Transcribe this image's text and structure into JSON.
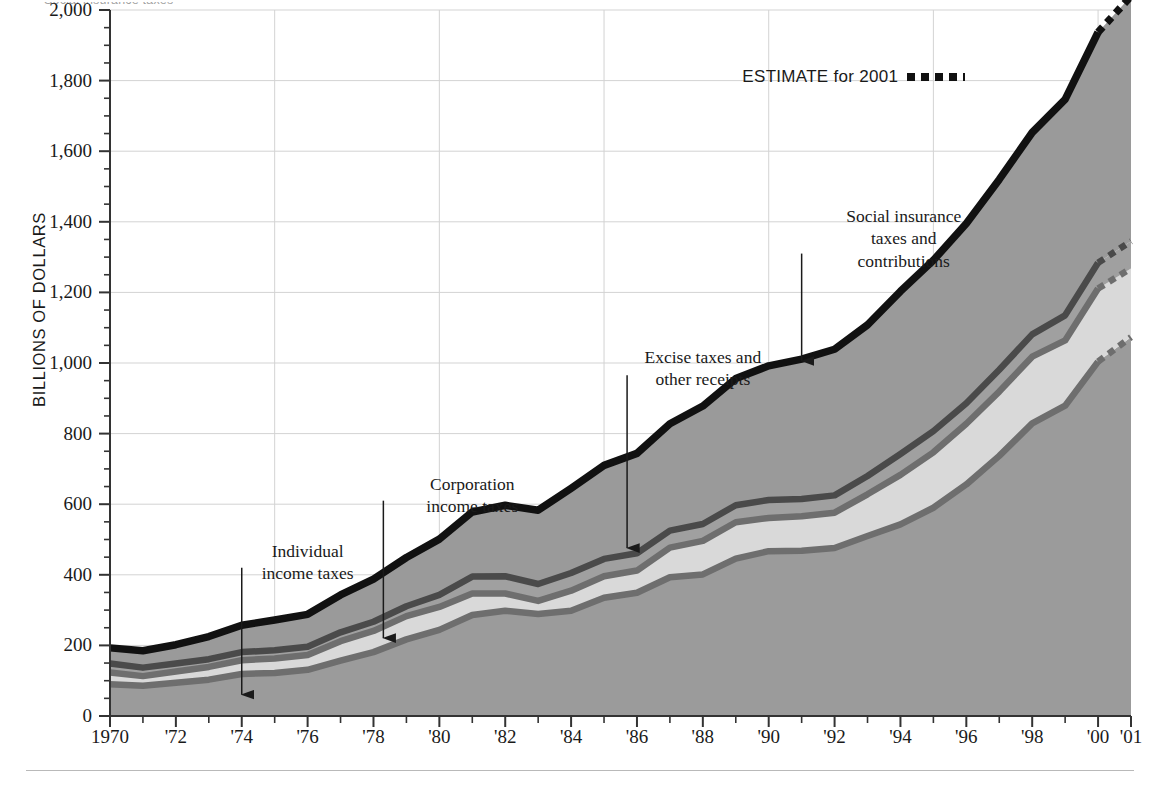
{
  "figure": {
    "top_caption_remnant": "Social insurance taxes",
    "bottom_rule": true
  },
  "legend": {
    "estimate_label": "ESTIMATE for 2001",
    "estimate_swatch": "dotted-black-line"
  },
  "chart_data": {
    "type": "area",
    "stacked": true,
    "title": "",
    "subtitle": "",
    "xlabel": "",
    "ylabel": "BILLIONS OF DOLLARS",
    "xlim": [
      1970,
      2001
    ],
    "ylim": [
      0,
      2000
    ],
    "grid": "light gray horizontal gridlines at every 200; vertical gridlines every 5 years",
    "legend_position": "inline annotations with arrows",
    "y_ticks": [
      0,
      200,
      400,
      600,
      800,
      1000,
      1200,
      1400,
      1600,
      1800,
      2000
    ],
    "y_tick_labels": [
      "0",
      "200",
      "400",
      "600",
      "800",
      "1,000",
      "1,200",
      "1,400",
      "1,600",
      "1,800",
      "2,000"
    ],
    "y_minor_tick_interval": 50,
    "x_ticks": [
      1970,
      1971,
      1972,
      1973,
      1974,
      1975,
      1976,
      1977,
      1978,
      1979,
      1980,
      1981,
      1982,
      1983,
      1984,
      1985,
      1986,
      1987,
      1988,
      1989,
      1990,
      1991,
      1992,
      1993,
      1994,
      1995,
      1996,
      1997,
      1998,
      1999,
      2000,
      2001
    ],
    "x_tick_labels": [
      {
        "x": 1970,
        "label": "1970"
      },
      {
        "x": 1972,
        "label": "'72"
      },
      {
        "x": 1974,
        "label": "'74"
      },
      {
        "x": 1976,
        "label": "'76"
      },
      {
        "x": 1978,
        "label": "'78"
      },
      {
        "x": 1980,
        "label": "'80"
      },
      {
        "x": 1982,
        "label": "'82"
      },
      {
        "x": 1984,
        "label": "'84"
      },
      {
        "x": 1986,
        "label": "'86"
      },
      {
        "x": 1988,
        "label": "'88"
      },
      {
        "x": 1990,
        "label": "'90"
      },
      {
        "x": 1992,
        "label": "'92"
      },
      {
        "x": 1994,
        "label": "'94"
      },
      {
        "x": 1996,
        "label": "'96"
      },
      {
        "x": 1998,
        "label": "'98"
      },
      {
        "x": 2000,
        "label": "'00"
      },
      {
        "x": 2001,
        "label": "'01"
      }
    ],
    "x_gridlines": [
      1975,
      1980,
      1985,
      1990,
      1995,
      2000
    ],
    "x": [
      1970,
      1971,
      1972,
      1973,
      1974,
      1975,
      1976,
      1977,
      1978,
      1979,
      1980,
      1981,
      1982,
      1983,
      1984,
      1985,
      1986,
      1987,
      1988,
      1989,
      1990,
      1991,
      1992,
      1993,
      1994,
      1995,
      1996,
      1997,
      1998,
      1999,
      2000,
      2001
    ],
    "estimate_year": 2001,
    "series": [
      {
        "name": "Individual income taxes",
        "color": "#9b9b9b",
        "border_color": "#6e6e6e",
        "values": [
          90,
          86,
          94,
          103,
          119,
          122,
          131,
          157,
          181,
          217,
          244,
          286,
          298,
          289,
          298,
          335,
          349,
          393,
          401,
          446,
          467,
          468,
          476,
          510,
          543,
          590,
          656,
          737,
          829,
          879,
          1004,
          1073
        ]
      },
      {
        "name": "Corporation income taxes",
        "color": "#d9d9d9",
        "border_color": "#6e6e6e",
        "values": [
          33,
          27,
          32,
          36,
          39,
          41,
          42,
          55,
          60,
          66,
          65,
          61,
          49,
          37,
          57,
          61,
          63,
          84,
          95,
          103,
          94,
          98,
          100,
          118,
          140,
          157,
          172,
          182,
          189,
          185,
          207,
          195
        ]
      },
      {
        "name": "Excise taxes and other receipts",
        "color": "#a0a0a0",
        "border_color": "#4a4a4a",
        "values": [
          26,
          24,
          23,
          22,
          23,
          23,
          23,
          25,
          26,
          28,
          34,
          48,
          49,
          48,
          50,
          49,
          49,
          48,
          48,
          48,
          51,
          49,
          49,
          52,
          59,
          60,
          58,
          62,
          63,
          71,
          73,
          77
        ]
      },
      {
        "name": "Social insurance taxes and contributions",
        "color": "#9a9a9a",
        "border_color": "#111111",
        "values": [
          44,
          48,
          53,
          64,
          76,
          86,
          92,
          106,
          121,
          138,
          158,
          183,
          201,
          209,
          240,
          265,
          283,
          303,
          334,
          359,
          380,
          396,
          414,
          428,
          461,
          484,
          509,
          539,
          572,
          612,
          653,
          694
        ]
      }
    ],
    "totals": [
      193,
      185,
      202,
      225,
      257,
      272,
      288,
      343,
      388,
      449,
      501,
      578,
      597,
      583,
      645,
      710,
      744,
      828,
      878,
      956,
      992,
      1011,
      1039,
      1108,
      1203,
      1291,
      1395,
      1520,
      1653,
      1747,
      1937,
      2039
    ],
    "annotations": [
      {
        "text": "Individual\nincome taxes",
        "target_series": "Individual income taxes",
        "label_x": 1976.0,
        "label_y": 470,
        "arrow_from_y": 420,
        "arrow_to_x": 1974.0,
        "arrow_to_y": 55
      },
      {
        "text": "Corporation\nincome taxes",
        "target_series": "Corporation income taxes",
        "label_x": 1981.0,
        "label_y": 660,
        "arrow_from_y": 610,
        "arrow_to_x": 1978.3,
        "arrow_to_y": 215
      },
      {
        "text": "Excise taxes and\nother receipts",
        "target_series": "Excise taxes and other receipts",
        "label_x": 1988.0,
        "label_y": 1020,
        "arrow_from_y": 965,
        "arrow_to_x": 1985.7,
        "arrow_to_y": 470
      },
      {
        "text": "Social insurance\ntaxes and\ncontributions",
        "target_series": "Social insurance taxes and contributions",
        "label_x": 1994.1,
        "label_y": 1420,
        "arrow_from_y": 1310,
        "arrow_to_x": 1991.0,
        "arrow_to_y": 1000
      }
    ]
  },
  "colors": {
    "individual": "#9b9b9b",
    "corporation": "#d9d9d9",
    "excise": "#a0a0a0",
    "social_insurance": "#9a9a9a",
    "top_line": "#111111",
    "gridline": "#d3d3d3",
    "axis": "#333333"
  }
}
